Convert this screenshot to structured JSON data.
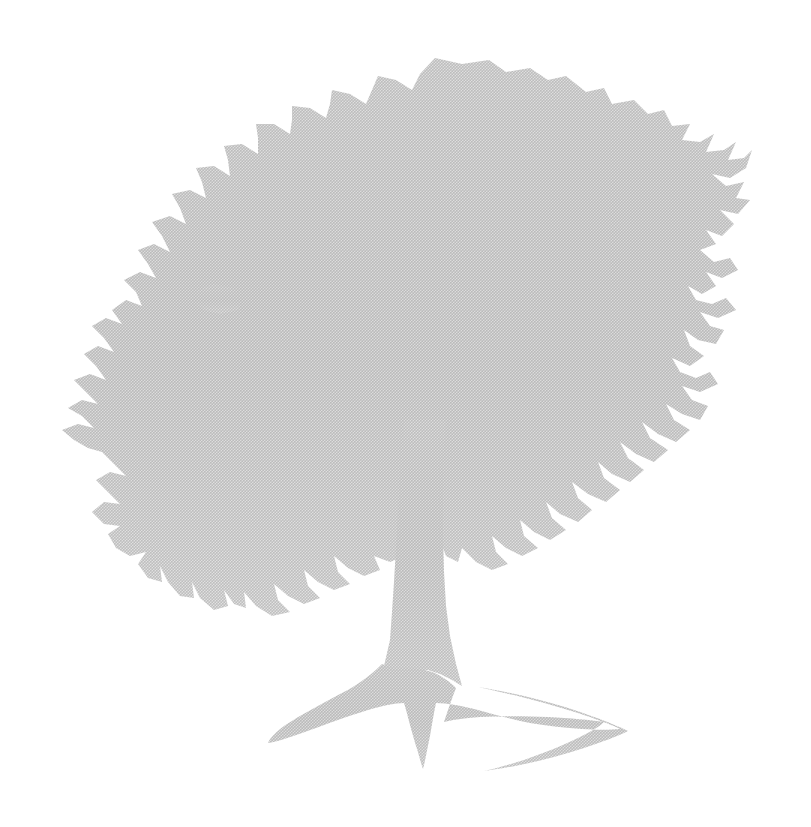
{
  "page": {
    "width": 811,
    "height": 827,
    "background_color": "#ffffff",
    "caption": ""
  },
  "artwork": {
    "name": "oak-tree-silhouette",
    "subject": "Broad-crowned oak tree with wide spreading surface roots",
    "style": "halftone dithered silhouette, scanned print watermark",
    "fill_color": "#dcdcdc",
    "edge_color": "#d4d4d4",
    "texture": "halftone dot screen",
    "orientation": "upright",
    "parts": [
      {
        "id": "canopy",
        "label": "Leaf canopy"
      },
      {
        "id": "trunk",
        "label": "Trunk"
      },
      {
        "id": "roots",
        "label": "Surface root flare"
      }
    ],
    "bounds": {
      "left": 60,
      "top": 58,
      "right": 755,
      "bottom": 772
    }
  },
  "chart_data": {
    "type": "scatter",
    "title": "",
    "xlabel": "",
    "ylabel": ""
  }
}
